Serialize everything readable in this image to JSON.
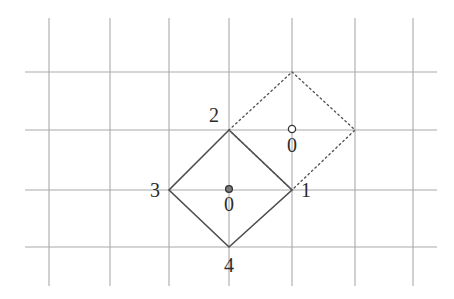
{
  "figure": {
    "title": "",
    "background_color": "#ffffff",
    "grid": {
      "line_color": "#a9a9a9",
      "line_width": 1.1,
      "vertical_x": [
        49,
        110,
        169,
        229,
        292,
        355,
        413
      ],
      "vertical_y_start": 18,
      "vertical_y_end": 286,
      "horizontal_y": [
        72,
        130,
        190,
        247
      ],
      "horizontal_x_start": 25,
      "horizontal_x_end": 437
    },
    "shapes": [
      {
        "name": "solid-diamond",
        "style": "solid",
        "stroke_color": "#4d4d4d",
        "stroke_width": 1.6,
        "points": [
          {
            "label": "2",
            "x": 229,
            "y": 130
          },
          {
            "label": "1",
            "x": 292,
            "y": 190
          },
          {
            "label": "4",
            "x": 229,
            "y": 247
          },
          {
            "label": "3",
            "x": 169,
            "y": 190
          }
        ]
      },
      {
        "name": "dotted-diamond",
        "style": "dotted",
        "stroke_color": "#555555",
        "stroke_width": 1.4,
        "dash_pattern": "1.6 3.2",
        "points": [
          {
            "x": 292,
            "y": 72
          },
          {
            "x": 355,
            "y": 130
          },
          {
            "x": 292,
            "y": 190
          },
          {
            "x": 229,
            "y": 130
          }
        ]
      }
    ],
    "markers": [
      {
        "name": "solid-center-dot",
        "fill": "#7a7a7a",
        "stroke": "#333333",
        "filled": true,
        "x": 229,
        "y": 189,
        "r": 3.4,
        "label": "0",
        "label_x": 229,
        "label_y": 211
      },
      {
        "name": "dotted-center-dot",
        "fill": "#ffffff",
        "stroke": "#333333",
        "filled": false,
        "x": 292,
        "y": 129,
        "r": 3.6,
        "label": "0",
        "label_x": 292,
        "label_y": 152
      }
    ],
    "vertex_labels": [
      {
        "name": "vertex-label-2",
        "text": "2",
        "x": 219,
        "y": 122,
        "anchor": "end"
      },
      {
        "name": "vertex-label-3",
        "text": "3",
        "x": 160,
        "y": 197,
        "anchor": "end"
      },
      {
        "name": "vertex-label-1",
        "text": "1",
        "x": 301,
        "y": 197,
        "anchor": "start"
      },
      {
        "name": "vertex-label-4",
        "text": "4",
        "x": 229,
        "y": 272,
        "anchor": "middle"
      }
    ]
  }
}
